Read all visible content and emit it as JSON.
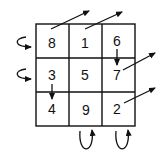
{
  "diagram": {
    "type": "magic-square",
    "grid": {
      "rows": [
        [
          "8",
          "1",
          "6"
        ],
        [
          "3",
          "5",
          "7"
        ],
        [
          "4",
          "9",
          "2"
        ]
      ]
    },
    "arrows": [
      {
        "name": "diagonal-arrow-8-out",
        "kind": "straight"
      },
      {
        "name": "diagonal-arrow-1-out",
        "kind": "straight"
      },
      {
        "name": "diagonal-arrow-7-out",
        "kind": "straight"
      },
      {
        "name": "diagonal-arrow-2-out",
        "kind": "straight"
      },
      {
        "name": "down-arrow-6-to-7",
        "kind": "straight"
      },
      {
        "name": "down-arrow-3-to-4",
        "kind": "straight"
      },
      {
        "name": "wrap-arrow-row-1-left",
        "kind": "curved"
      },
      {
        "name": "wrap-arrow-row-2-left",
        "kind": "curved"
      },
      {
        "name": "wrap-arrow-col-2-bottom",
        "kind": "curved"
      },
      {
        "name": "wrap-arrow-col-3-bottom",
        "kind": "curved"
      }
    ],
    "colors": {
      "ink": "#111111",
      "background": "#ffffff"
    }
  }
}
